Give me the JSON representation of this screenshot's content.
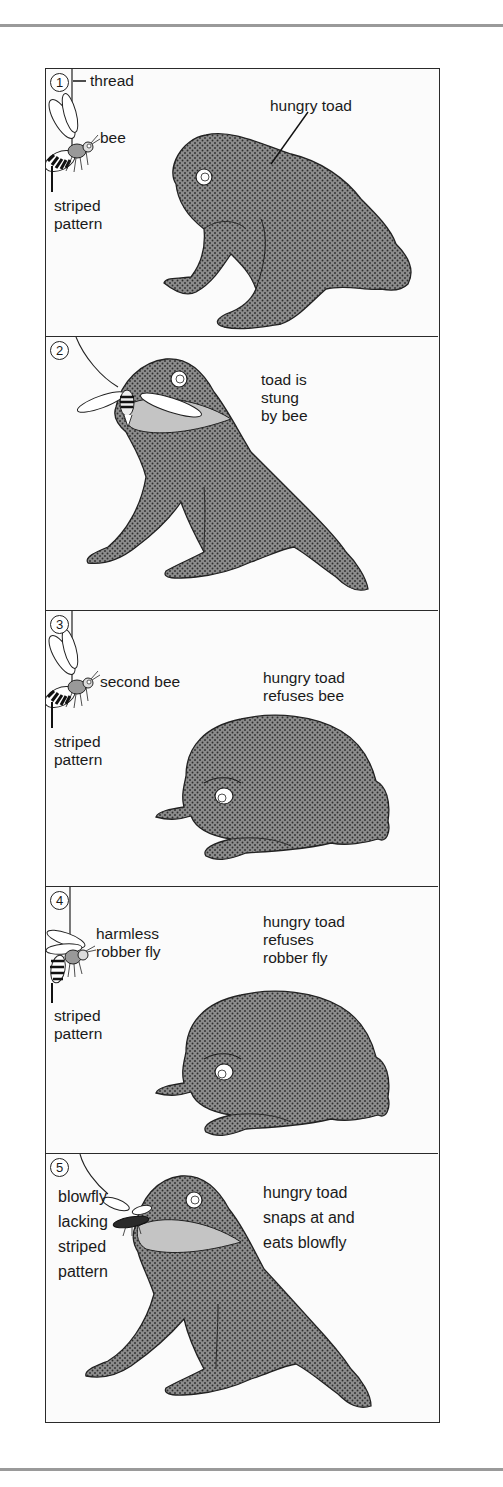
{
  "colors": {
    "toad_fill": "#8c8c8c",
    "toad_dot": "#2e2e2e",
    "outline": "#2a2a2a",
    "mouth": "#c4c4c4",
    "frame_bg": "#fbfbfb",
    "rule": "#9a9a9a"
  },
  "panels": [
    {
      "number": "1",
      "labels": {
        "thread": "thread",
        "insect": "bee",
        "pattern": "striped\npattern",
        "toad": "hungry toad"
      }
    },
    {
      "number": "2",
      "labels": {
        "caption": "toad is\nstung\nby bee"
      }
    },
    {
      "number": "3",
      "labels": {
        "insect": "second bee",
        "pattern": "striped\npattern",
        "caption": "hungry toad\nrefuses bee"
      }
    },
    {
      "number": "4",
      "labels": {
        "insect": "harmless\nrobber fly",
        "pattern": "striped\npattern",
        "caption": "hungry toad\nrefuses\nrobber fly"
      }
    },
    {
      "number": "5",
      "labels": {
        "insect": "blowfly\nlacking\nstriped\npattern",
        "caption": "hungry toad\nsnaps at and\neats blowfly"
      }
    }
  ]
}
